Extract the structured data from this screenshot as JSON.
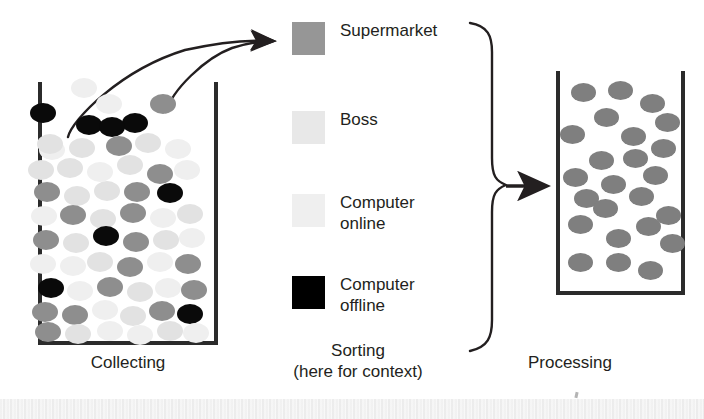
{
  "figure": {
    "width": 704,
    "height": 419
  },
  "legend": {
    "items": [
      {
        "label": "Supermarket",
        "key": "supermarket",
        "color": "#969696"
      },
      {
        "label": "Boss",
        "key": "boss",
        "color": "#e8e8e8"
      },
      {
        "label": "Computer\nonline",
        "key": "online",
        "color": "#efefef"
      },
      {
        "label": "Computer\noffline",
        "key": "offline",
        "color": "#000000"
      }
    ]
  },
  "captions": {
    "collecting": "Collecting",
    "sorting": "Sorting\n(here for context)",
    "processing": "Processing"
  },
  "colors": {
    "outline": "#2b2b2b",
    "arrow": "#231f20",
    "text": "#231f20",
    "supermarket": "#8e8e8e",
    "boss": "#e2e2e2",
    "computer_online": "#efefef",
    "computer_offline": "#0a0a0a",
    "processed": "#7f7f7f"
  },
  "chart_data": {
    "type": "diagram",
    "stages": [
      "Collecting",
      "Sorting (here for context)",
      "Processing"
    ],
    "legend_categories": [
      "Supermarket",
      "Boss",
      "Computer online",
      "Computer offline"
    ],
    "collecting_container": {
      "label": "Collecting",
      "mixed": true,
      "counts": {
        "supermarket": 18,
        "boss": 16,
        "online": 18,
        "offline": 8
      },
      "dots": [
        {
          "x": 52,
          "y": 150,
          "c": "online"
        },
        {
          "x": 84,
          "y": 88,
          "c": "online"
        },
        {
          "x": 43,
          "y": 113,
          "c": "offline"
        },
        {
          "x": 89,
          "y": 125,
          "c": "offline"
        },
        {
          "x": 109,
          "y": 104,
          "c": "online"
        },
        {
          "x": 135,
          "y": 123,
          "c": "offline"
        },
        {
          "x": 163,
          "y": 104,
          "c": "supermarket"
        },
        {
          "x": 112,
          "y": 127,
          "c": "offline"
        },
        {
          "x": 50,
          "y": 144,
          "c": "boss"
        },
        {
          "x": 82,
          "y": 148,
          "c": "boss"
        },
        {
          "x": 119,
          "y": 146,
          "c": "supermarket"
        },
        {
          "x": 148,
          "y": 143,
          "c": "boss"
        },
        {
          "x": 178,
          "y": 149,
          "c": "online"
        },
        {
          "x": 41,
          "y": 170,
          "c": "boss"
        },
        {
          "x": 70,
          "y": 168,
          "c": "boss"
        },
        {
          "x": 100,
          "y": 172,
          "c": "online"
        },
        {
          "x": 130,
          "y": 165,
          "c": "boss"
        },
        {
          "x": 160,
          "y": 174,
          "c": "supermarket"
        },
        {
          "x": 187,
          "y": 170,
          "c": "online"
        },
        {
          "x": 47,
          "y": 192,
          "c": "supermarket"
        },
        {
          "x": 77,
          "y": 196,
          "c": "boss"
        },
        {
          "x": 107,
          "y": 191,
          "c": "boss"
        },
        {
          "x": 137,
          "y": 192,
          "c": "supermarket"
        },
        {
          "x": 170,
          "y": 193,
          "c": "offline"
        },
        {
          "x": 44,
          "y": 216,
          "c": "online"
        },
        {
          "x": 73,
          "y": 215,
          "c": "supermarket"
        },
        {
          "x": 103,
          "y": 219,
          "c": "boss"
        },
        {
          "x": 133,
          "y": 213,
          "c": "supermarket"
        },
        {
          "x": 163,
          "y": 218,
          "c": "online"
        },
        {
          "x": 190,
          "y": 214,
          "c": "boss"
        },
        {
          "x": 46,
          "y": 240,
          "c": "supermarket"
        },
        {
          "x": 76,
          "y": 243,
          "c": "boss"
        },
        {
          "x": 106,
          "y": 236,
          "c": "offline"
        },
        {
          "x": 136,
          "y": 242,
          "c": "supermarket"
        },
        {
          "x": 166,
          "y": 240,
          "c": "boss"
        },
        {
          "x": 192,
          "y": 238,
          "c": "online"
        },
        {
          "x": 43,
          "y": 264,
          "c": "online"
        },
        {
          "x": 73,
          "y": 266,
          "c": "online"
        },
        {
          "x": 100,
          "y": 262,
          "c": "boss"
        },
        {
          "x": 130,
          "y": 267,
          "c": "supermarket"
        },
        {
          "x": 160,
          "y": 262,
          "c": "online"
        },
        {
          "x": 188,
          "y": 264,
          "c": "supermarket"
        },
        {
          "x": 51,
          "y": 288,
          "c": "offline"
        },
        {
          "x": 80,
          "y": 291,
          "c": "online"
        },
        {
          "x": 110,
          "y": 287,
          "c": "supermarket"
        },
        {
          "x": 140,
          "y": 292,
          "c": "boss"
        },
        {
          "x": 168,
          "y": 288,
          "c": "online"
        },
        {
          "x": 194,
          "y": 290,
          "c": "supermarket"
        },
        {
          "x": 45,
          "y": 312,
          "c": "supermarket"
        },
        {
          "x": 75,
          "y": 315,
          "c": "supermarket"
        },
        {
          "x": 105,
          "y": 310,
          "c": "online"
        },
        {
          "x": 133,
          "y": 316,
          "c": "boss"
        },
        {
          "x": 162,
          "y": 311,
          "c": "supermarket"
        },
        {
          "x": 190,
          "y": 314,
          "c": "offline"
        },
        {
          "x": 48,
          "y": 332,
          "c": "supermarket"
        },
        {
          "x": 78,
          "y": 334,
          "c": "boss"
        },
        {
          "x": 110,
          "y": 331,
          "c": "online"
        },
        {
          "x": 140,
          "y": 335,
          "c": "online"
        },
        {
          "x": 170,
          "y": 331,
          "c": "boss"
        },
        {
          "x": 196,
          "y": 333,
          "c": "online"
        }
      ]
    },
    "processing_container": {
      "label": "Processing",
      "mixed": false,
      "category": "Supermarket",
      "count": 24,
      "dots": [
        {
          "x": 583,
          "y": 92
        },
        {
          "x": 620,
          "y": 90
        },
        {
          "x": 652,
          "y": 103
        },
        {
          "x": 606,
          "y": 117
        },
        {
          "x": 667,
          "y": 122
        },
        {
          "x": 572,
          "y": 134
        },
        {
          "x": 633,
          "y": 136
        },
        {
          "x": 663,
          "y": 148
        },
        {
          "x": 601,
          "y": 160
        },
        {
          "x": 635,
          "y": 158
        },
        {
          "x": 575,
          "y": 177
        },
        {
          "x": 655,
          "y": 175
        },
        {
          "x": 613,
          "y": 184
        },
        {
          "x": 586,
          "y": 198
        },
        {
          "x": 641,
          "y": 196
        },
        {
          "x": 605,
          "y": 208
        },
        {
          "x": 668,
          "y": 215
        },
        {
          "x": 580,
          "y": 224
        },
        {
          "x": 648,
          "y": 226
        },
        {
          "x": 618,
          "y": 238
        },
        {
          "x": 672,
          "y": 243
        },
        {
          "x": 580,
          "y": 262
        },
        {
          "x": 618,
          "y": 262
        },
        {
          "x": 650,
          "y": 270
        }
      ]
    },
    "arrows": [
      {
        "name": "sort-arrow-offline",
        "from": [
          68,
          132
        ],
        "to": [
          281,
          43
        ]
      },
      {
        "name": "sort-arrow-supermarket",
        "from": [
          166,
          108
        ],
        "to": [
          281,
          43
        ]
      },
      {
        "name": "process-arrow",
        "from": [
          504,
          186
        ],
        "to": [
          554,
          186
        ]
      }
    ],
    "brace": {
      "spans": [
        "Supermarket",
        "Boss",
        "Computer online",
        "Computer offline"
      ],
      "top": 22,
      "bottom": 352,
      "tip_y": 186
    }
  }
}
